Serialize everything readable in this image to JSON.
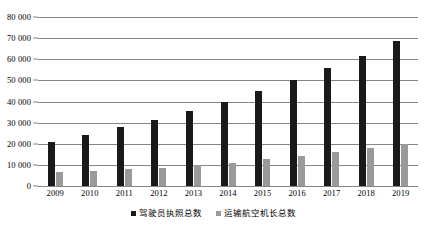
{
  "chart_data": {
    "type": "bar",
    "title": "",
    "subtitle": "",
    "xlabel": "",
    "ylabel": "",
    "categories": [
      "2009",
      "2010",
      "2011",
      "2012",
      "2013",
      "2014",
      "2015",
      "2016",
      "2017",
      "2018",
      "2019"
    ],
    "series": [
      {
        "name": "驾驶员执照总数",
        "color": "#1a1a1a",
        "values": [
          20700,
          24200,
          27900,
          31200,
          35500,
          40000,
          44800,
          50300,
          55800,
          61500,
          68500
        ]
      },
      {
        "name": "运输航空机长总数",
        "color": "#9a9a9a",
        "values": [
          6400,
          7100,
          8100,
          8700,
          10000,
          11100,
          12800,
          14300,
          16000,
          17800,
          19800
        ]
      }
    ],
    "ylim": [
      0,
      80000
    ],
    "ytick_step": 10000,
    "ytick_labels": [
      "0",
      "10 000",
      "20 000",
      "30 000",
      "40 000",
      "50 000",
      "60 000",
      "70 000",
      "80 000"
    ],
    "ytick_values": [
      0,
      10000,
      20000,
      30000,
      40000,
      50000,
      60000,
      70000,
      80000
    ],
    "grid": true,
    "grid_axis": "y",
    "legend_position": "bottom",
    "legend_entries": [
      "驾驶员执照总数",
      "运输航空机长总数"
    ]
  }
}
